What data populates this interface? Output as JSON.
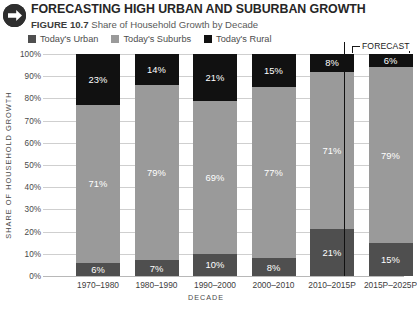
{
  "header": {
    "icon": "arrow-right-circle-icon",
    "title": "FORECASTING HIGH URBAN AND SUBURBAN GROWTH",
    "figure_number": "FIGURE 10.7",
    "figure_caption": "Share of Household Growth by Decade"
  },
  "forecast_marker": {
    "label": "FORECAST"
  },
  "chart_data": {
    "type": "bar",
    "stacked": true,
    "title": "FORECASTING HIGH URBAN AND SUBURBAN GROWTH",
    "subtitle": "Share of Household Growth by Decade",
    "xlabel": "DECADE",
    "ylabel": "SHARE OF HOUSEHOLD GROWTH",
    "ylim": [
      0,
      100
    ],
    "yticks": [
      "0%",
      "10%",
      "20%",
      "30%",
      "40%",
      "50%",
      "60%",
      "70%",
      "80%",
      "90%",
      "100%"
    ],
    "ytick_values": [
      0,
      10,
      20,
      30,
      40,
      50,
      60,
      70,
      80,
      90,
      100
    ],
    "grid": true,
    "legend_position": "top",
    "categories": [
      "1970–1980",
      "1980–1990",
      "1990–2000",
      "2000–2010",
      "2010–2015P",
      "2015P–2025P"
    ],
    "series": [
      {
        "name": "Today's Urban",
        "color": "#4f4f4f",
        "values": [
          6,
          7,
          10,
          8,
          21,
          15
        ],
        "labels": [
          "6%",
          "7%",
          "10%",
          "8%",
          "21%",
          "15%"
        ]
      },
      {
        "name": "Today's Suburbs",
        "color": "#9a9a9a",
        "values": [
          71,
          79,
          69,
          77,
          71,
          79
        ],
        "labels": [
          "71%",
          "79%",
          "69%",
          "77%",
          "71%",
          "79%"
        ]
      },
      {
        "name": "Today's Rural",
        "color": "#111111",
        "values": [
          23,
          14,
          21,
          15,
          8,
          6
        ],
        "labels": [
          "23%",
          "14%",
          "21%",
          "15%",
          "8%",
          "6%"
        ]
      }
    ],
    "annotations": [
      {
        "text": "FORECAST",
        "covers": [
          "2015P–2025P"
        ]
      }
    ]
  }
}
